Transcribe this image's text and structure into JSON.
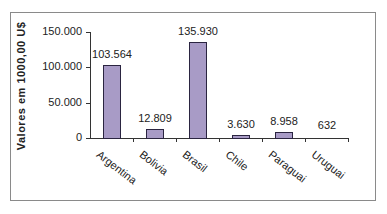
{
  "chart_data": {
    "type": "bar",
    "title": "",
    "xlabel": "",
    "ylabel": "Valores em 1000,00 U$",
    "categories": [
      "Argentina",
      "Bolivia",
      "Brasil",
      "Chile",
      "Paraguai",
      "Uruguai"
    ],
    "values": [
      103564,
      12809,
      135930,
      3630,
      8958,
      632
    ],
    "data_labels": [
      "103.564",
      "12.809",
      "135.930",
      "3.630",
      "8.958",
      "632"
    ],
    "ylim": [
      0,
      150000
    ],
    "yticks": [
      0,
      50000,
      100000,
      150000
    ],
    "ytick_labels": [
      "0",
      "50.000",
      "100.000",
      "150.000"
    ],
    "grid": false,
    "legend": null,
    "bar_color": "#a89bc6",
    "bar_edge_color": "#2a2440"
  }
}
